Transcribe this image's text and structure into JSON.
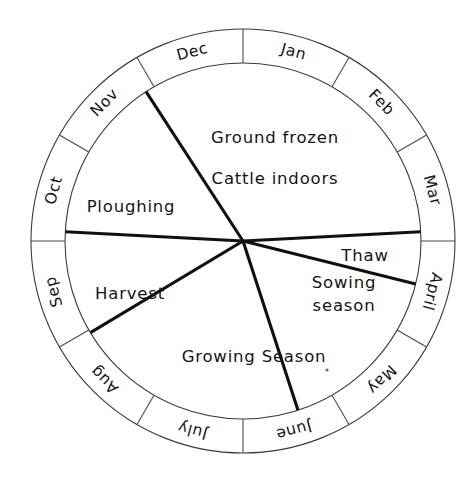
{
  "figure": {
    "center": {
      "x": 243,
      "y": 241
    },
    "outer_radius": 212,
    "inner_radius": 178,
    "stroke_color": "#141414",
    "ring_stroke_color": "#4a4a4a",
    "background_color": "#ffffff"
  },
  "chart_data": {
    "type": "pie",
    "xlabel": "",
    "ylabel": "",
    "grid": false,
    "legend": "none",
    "months": [
      {
        "label": "Jan",
        "start_deg": -90,
        "end_deg": -60,
        "mid_deg": -75
      },
      {
        "label": "Feb",
        "start_deg": -60,
        "end_deg": -30,
        "mid_deg": -45
      },
      {
        "label": "Mar",
        "start_deg": -30,
        "end_deg": 0,
        "mid_deg": -15
      },
      {
        "label": "April",
        "start_deg": 0,
        "end_deg": 30,
        "mid_deg": 15
      },
      {
        "label": "May",
        "start_deg": 30,
        "end_deg": 60,
        "mid_deg": 45
      },
      {
        "label": "June",
        "start_deg": 60,
        "end_deg": 90,
        "mid_deg": 75
      },
      {
        "label": "July",
        "start_deg": 90,
        "end_deg": 120,
        "mid_deg": 105
      },
      {
        "label": "Aug",
        "start_deg": 120,
        "end_deg": 150,
        "mid_deg": 135
      },
      {
        "label": "Sep",
        "start_deg": 150,
        "end_deg": 180,
        "mid_deg": 165
      },
      {
        "label": "Oct",
        "start_deg": 180,
        "end_deg": 210,
        "mid_deg": 195
      },
      {
        "label": "Nov",
        "start_deg": 210,
        "end_deg": 240,
        "mid_deg": 225
      },
      {
        "label": "Dec",
        "start_deg": 240,
        "end_deg": 270,
        "mid_deg": 255
      }
    ],
    "categories": [
      "Ground frozen / Cattle indoors",
      "Thaw",
      "Sowing season",
      "Growing Season",
      "Harvest",
      "Ploughing"
    ],
    "values": [
      120,
      17,
      58,
      77,
      54,
      34
    ],
    "sectors": [
      {
        "id": "winter",
        "lines": [
          "Ground frozen",
          "Cattle indoors"
        ],
        "start_deg": -123,
        "end_deg": -3,
        "label_x": 275,
        "label_y": 137,
        "line_gap": 41
      },
      {
        "id": "thaw",
        "lines": [
          "Thaw"
        ],
        "start_deg": -3,
        "end_deg": 14,
        "label_x": 365,
        "label_y": 255,
        "line_gap": 0
      },
      {
        "id": "sowing",
        "lines": [
          "Sowing",
          "season"
        ],
        "start_deg": 14,
        "end_deg": 72,
        "label_x": 344,
        "label_y": 282,
        "line_gap": 23
      },
      {
        "id": "growing",
        "lines": [
          "Growing Season"
        ],
        "start_deg": 72,
        "end_deg": 149,
        "label_x": 254,
        "label_y": 356,
        "line_gap": 0
      },
      {
        "id": "harvest",
        "lines": [
          "Harvest"
        ],
        "start_deg": 149,
        "end_deg": 183,
        "label_x": 130,
        "label_y": 293,
        "line_gap": 0
      },
      {
        "id": "ploughing",
        "lines": [
          "Ploughing"
        ],
        "start_deg": 183,
        "end_deg": 237,
        "label_x": 131,
        "label_y": 206,
        "line_gap": 0
      }
    ],
    "sector_boundary_angles_deg": [
      -123,
      -3,
      14,
      72,
      149,
      183
    ],
    "speck": {
      "x": 327,
      "y": 370
    }
  }
}
